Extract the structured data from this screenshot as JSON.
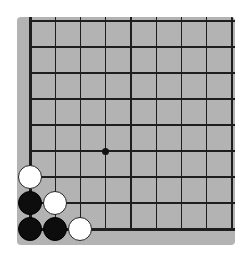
{
  "board": {
    "view": "bottom-left corner section",
    "columns": 9,
    "rows": 9,
    "background_color": "#b3b3b3",
    "line_color": "#1e1e1e",
    "origin_px": {
      "x": 30,
      "y": 21
    },
    "spacing_px": {
      "x": 25.25,
      "y": 26
    },
    "edges": {
      "left": true,
      "bottom": true,
      "top": false,
      "right": false
    },
    "star_points": [
      {
        "col": 3,
        "row": 5
      }
    ],
    "stones": [
      {
        "col": 0,
        "row": 6,
        "color": "white"
      },
      {
        "col": 0,
        "row": 7,
        "color": "black"
      },
      {
        "col": 1,
        "row": 7,
        "color": "white"
      },
      {
        "col": 0,
        "row": 8,
        "color": "black"
      },
      {
        "col": 1,
        "row": 8,
        "color": "black"
      },
      {
        "col": 2,
        "row": 8,
        "color": "white"
      }
    ]
  }
}
